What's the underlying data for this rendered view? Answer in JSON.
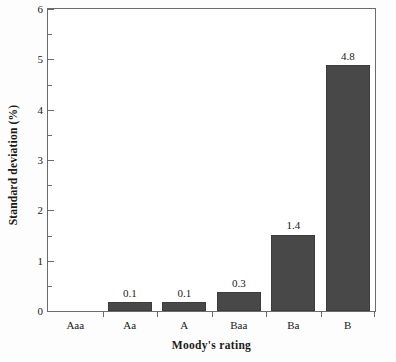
{
  "chart_data": {
    "type": "bar",
    "title": "",
    "xlabel": "Moody's rating",
    "ylabel": "Standard deviation (%)",
    "categories": [
      "Aaa",
      "Aa",
      "A",
      "Baa",
      "Ba",
      "B"
    ],
    "values": [
      0,
      0.1,
      0.1,
      0.3,
      1.4,
      4.8
    ],
    "bar_heights_plotted": [
      0,
      0.17,
      0.17,
      0.38,
      1.52,
      4.88
    ],
    "data_labels": [
      "",
      "0.1",
      "0.1",
      "0.3",
      "1.4",
      "4.8"
    ],
    "ylim": [
      0,
      6
    ],
    "xlim_categories": 6,
    "y_major_ticks": [
      0,
      1,
      2,
      3,
      4,
      5,
      6
    ],
    "y_tick_labels": [
      "0",
      "1",
      "2",
      "3",
      "4",
      "5",
      "6"
    ],
    "y_minor_ticks": [
      0.5,
      1.5,
      2.5,
      3.5,
      4.5,
      5.5
    ],
    "grid": false,
    "legend": false,
    "legend_position": "none",
    "bar_color": "#484848",
    "bar_edge_color": "#3c3c3c",
    "axis_color": "#6b6b6b",
    "background_color": "#ffffff",
    "text_color": "#1a1a1a",
    "bar_width_fraction": 0.8
  }
}
